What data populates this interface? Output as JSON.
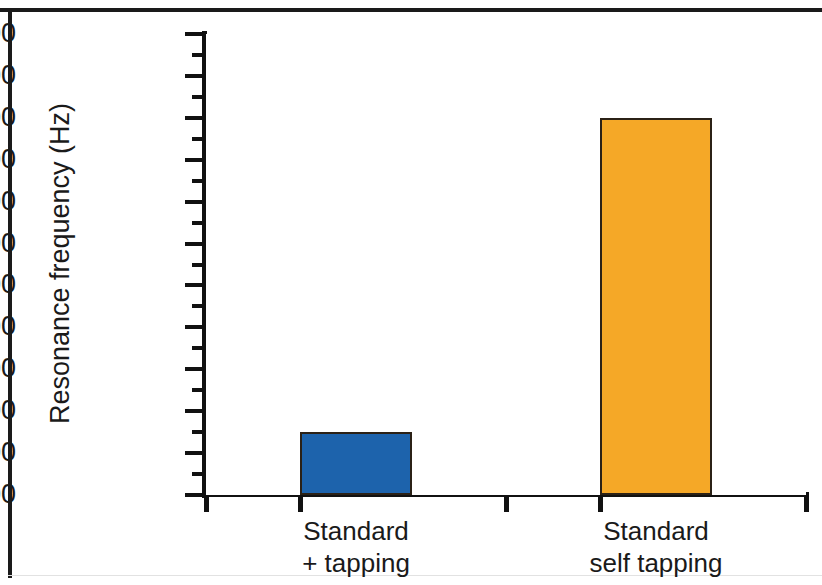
{
  "chart_data": {
    "type": "bar",
    "title": "",
    "subtitle": "",
    "xlabel": "",
    "ylabel": "Resonance frequency (Hz)",
    "categories": [
      "Standard\n+ tapping",
      "Standard\nself tapping"
    ],
    "category_lines": [
      [
        "Standard",
        "+ tapping"
      ],
      [
        "Standard",
        "self tapping"
      ]
    ],
    "values": [
      6100,
      7600
    ],
    "ylim": [
      5800,
      8000
    ],
    "ytick_step": 200,
    "yminor_step": 100,
    "ytick_labels": [
      "8000",
      "7800",
      "7600",
      "7400",
      "7200",
      "7000",
      "6800",
      "6600",
      "6400",
      "6200",
      "6000",
      "5800"
    ],
    "ytick_values": [
      8000,
      7800,
      7600,
      7400,
      7200,
      7000,
      6800,
      6600,
      6400,
      6200,
      6000,
      5800
    ],
    "yminor_values": [
      7900,
      7700,
      7500,
      7300,
      7100,
      6900,
      6700,
      6500,
      6300,
      6100,
      5900
    ],
    "grid": false,
    "legend": null,
    "legend_position": "none",
    "series": [
      {
        "name": "Resonance frequency",
        "values": [
          6100,
          7600
        ],
        "colors": [
          "#1d63ac",
          "#f5a827"
        ]
      }
    ],
    "bar_colors": {
      "standard_plus_tapping": "#1d63ac",
      "standard_self_tapping": "#f5a827",
      "bar_border": "#2b2116"
    },
    "axis_color": "#111111",
    "frame_color": "#1a1a1a",
    "background": "#ffffff",
    "units": "Hz"
  },
  "axis": {
    "y_title": "Resonance frequency (Hz)"
  }
}
